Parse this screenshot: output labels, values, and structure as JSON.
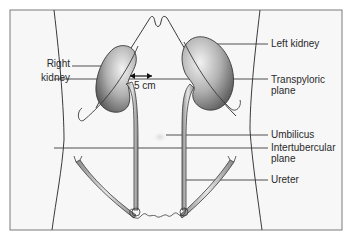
{
  "diagram": {
    "labels": {
      "right_kidney_line1": "Right",
      "right_kidney_line2": "kidney",
      "distance": "5 cm",
      "left_kidney": "Left kidney",
      "transpyloric_line1": "Transpyloric",
      "transpyloric_line2": "plane",
      "umbilicus": "Umbilicus",
      "intertubercular_line1": "Intertubercular",
      "intertubercular_line2": "plane",
      "ureter": "Ureter"
    },
    "colors": {
      "frame": "#7a7a7a",
      "outline": "#3a3a3a",
      "kidney_dark": "#5a5a5a",
      "kidney_light": "#e8e8e8",
      "background": "#f7f7f7"
    }
  }
}
